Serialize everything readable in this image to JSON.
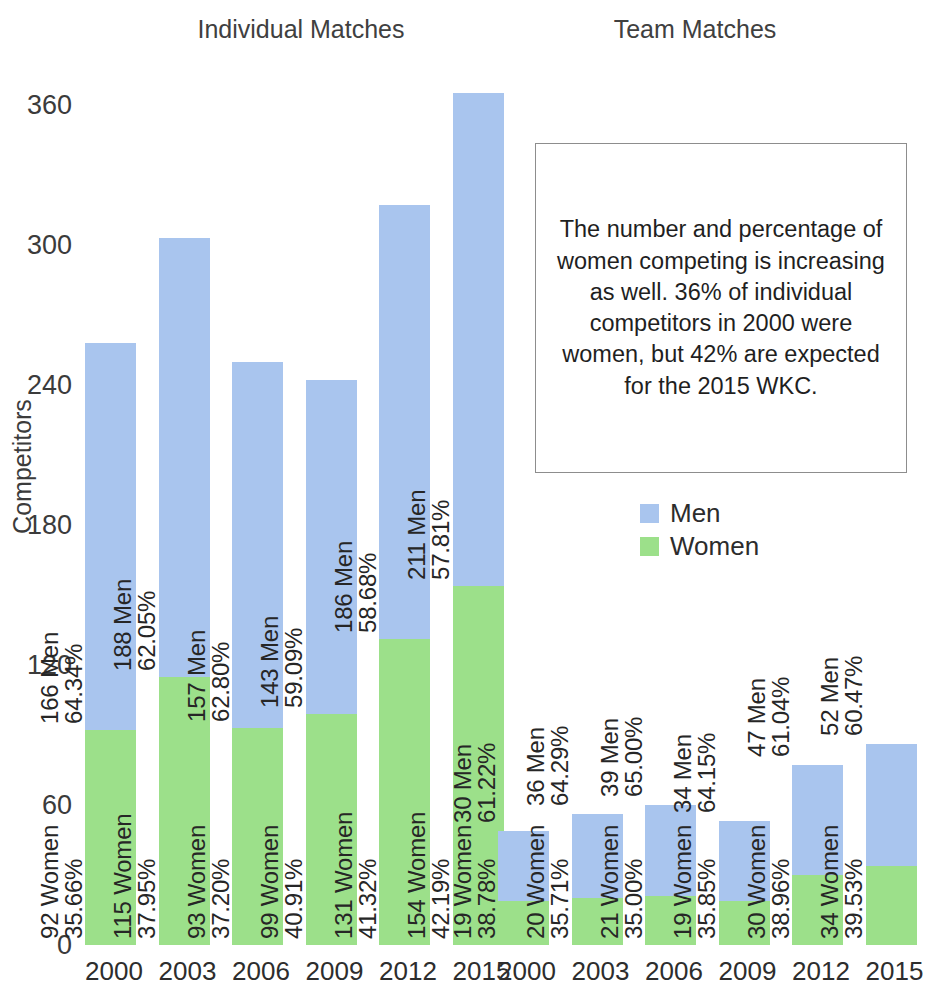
{
  "headings": {
    "individual": "Individual Matches",
    "team": "Team Matches"
  },
  "axes": {
    "y_title": "Competitors",
    "y_ticks": [
      "0",
      "60",
      "120",
      "180",
      "240",
      "300",
      "360"
    ]
  },
  "legend": {
    "position": "right-middle",
    "items": [
      {
        "label": "Men",
        "color": "#a9c5ee"
      },
      {
        "label": "Women",
        "color": "#9ce08a"
      }
    ]
  },
  "annotation": {
    "text": "The number and percentage of women competing is increasing as well. 36% of individual competitors in 2000 were women, but 42% are expected for the 2015 WKC."
  },
  "colors": {
    "men": "#a9c5ee",
    "women": "#9ce08a",
    "text": "#262626",
    "box_border": "#8d8d8d",
    "background": "#ffffff"
  },
  "chart_data": {
    "type": "bar",
    "title": "",
    "subtitle": "",
    "xlabel": "",
    "ylabel": "Competitors",
    "ylim": [
      0,
      370
    ],
    "yticks": [
      0,
      60,
      120,
      180,
      240,
      300,
      360
    ],
    "grid": false,
    "stacked": true,
    "legend": [
      "Men",
      "Women"
    ],
    "panels": [
      {
        "name": "Individual Matches",
        "categories": [
          "2000",
          "2003",
          "2006",
          "2009",
          "2012",
          "2015"
        ],
        "series": [
          {
            "name": "Women",
            "values": [
              92,
              115,
              93,
              99,
              131,
              154
            ]
          },
          {
            "name": "Men",
            "values": [
              166,
              188,
              157,
              143,
              186,
              211
            ]
          }
        ],
        "percents": {
          "Women": [
            "35.66%",
            "37.95%",
            "37.20%",
            "40.91%",
            "41.32%",
            "42.19%"
          ],
          "Men": [
            "64.34%",
            "62.05%",
            "62.80%",
            "59.09%",
            "58.68%",
            "57.81%"
          ]
        },
        "totals": [
          258,
          303,
          250,
          242,
          317,
          365
        ],
        "bars": [
          {
            "year": "2000",
            "women_label_line1": "92 Women",
            "women_label_line2": "35.66%",
            "men_label_line1": "166 Men",
            "men_label_line2": "64.34%",
            "women": 92,
            "men": 166,
            "total": 258
          },
          {
            "year": "2003",
            "women_label_line1": "115 Women",
            "women_label_line2": "37.95%",
            "men_label_line1": "188 Men",
            "men_label_line2": "62.05%",
            "women": 115,
            "men": 188,
            "total": 303
          },
          {
            "year": "2006",
            "women_label_line1": "93 Women",
            "women_label_line2": "37.20%",
            "men_label_line1": "157 Men",
            "men_label_line2": "62.80%",
            "women": 93,
            "men": 157,
            "total": 250
          },
          {
            "year": "2009",
            "women_label_line1": "99 Women",
            "women_label_line2": "40.91%",
            "men_label_line1": "143 Men",
            "men_label_line2": "59.09%",
            "women": 99,
            "men": 143,
            "total": 242
          },
          {
            "year": "2012",
            "women_label_line1": "131 Women",
            "women_label_line2": "41.32%",
            "men_label_line1": "186 Men",
            "men_label_line2": "58.68%",
            "women": 131,
            "men": 186,
            "total": 317
          },
          {
            "year": "2015",
            "women_label_line1": "154 Women",
            "women_label_line2": "42.19%",
            "men_label_line1": "211 Men",
            "men_label_line2": "57.81%",
            "women": 154,
            "men": 211,
            "total": 365
          }
        ]
      },
      {
        "name": "Team Matches",
        "categories": [
          "2000",
          "2003",
          "2006",
          "2009",
          "2012",
          "2015"
        ],
        "series": [
          {
            "name": "Women",
            "values": [
              19,
              20,
              21,
              19,
              30,
              34
            ]
          },
          {
            "name": "Men",
            "values": [
              30,
              36,
              39,
              34,
              47,
              52
            ]
          }
        ],
        "percents": {
          "Women": [
            "38.78%",
            "35.71%",
            "35.00%",
            "35.85%",
            "38.96%",
            "39.53%"
          ],
          "Men": [
            "61.22%",
            "64.29%",
            "65.00%",
            "64.15%",
            "61.04%",
            "60.47%"
          ]
        },
        "totals": [
          49,
          56,
          60,
          53,
          77,
          86
        ],
        "bars": [
          {
            "year": "2000",
            "women_label_line1": "19 Women",
            "women_label_line2": "38.78%",
            "men_label_line1": "30 Men",
            "men_label_line2": "61.22%",
            "women": 19,
            "men": 30,
            "total": 49
          },
          {
            "year": "2003",
            "women_label_line1": "20 Women",
            "women_label_line2": "35.71%",
            "men_label_line1": "36 Men",
            "men_label_line2": "64.29%",
            "women": 20,
            "men": 36,
            "total": 56
          },
          {
            "year": "2006",
            "women_label_line1": "21 Women",
            "women_label_line2": "35.00%",
            "men_label_line1": "39 Men",
            "men_label_line2": "65.00%",
            "women": 21,
            "men": 39,
            "total": 60
          },
          {
            "year": "2009",
            "women_label_line1": "19 Women",
            "women_label_line2": "35.85%",
            "men_label_line1": "34 Men",
            "men_label_line2": "64.15%",
            "women": 19,
            "men": 34,
            "total": 53
          },
          {
            "year": "2012",
            "women_label_line1": "30 Women",
            "women_label_line2": "38.96%",
            "men_label_line1": "47 Men",
            "men_label_line2": "61.04%",
            "women": 30,
            "men": 47,
            "total": 77
          },
          {
            "year": "2015",
            "women_label_line1": "34 Women",
            "women_label_line2": "39.53%",
            "men_label_line1": "52 Men",
            "men_label_line2": "60.47%",
            "women": 34,
            "men": 52,
            "total": 86
          }
        ]
      }
    ]
  }
}
